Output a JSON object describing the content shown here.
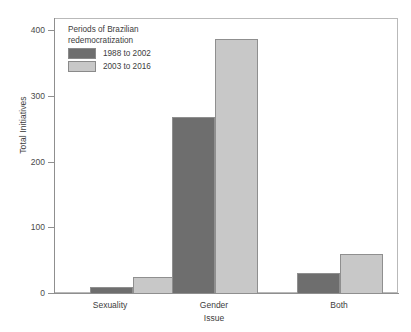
{
  "chart_data": {
    "type": "bar",
    "title": "",
    "xlabel": "Issue",
    "ylabel": "Total Initiatives",
    "categories": [
      "Sexuality",
      "Gender",
      "Both"
    ],
    "series": [
      {
        "name": "1988 to 2002",
        "color": "#6e6e6e",
        "values": [
          11,
          270,
          32
        ]
      },
      {
        "name": "2003 to 2016",
        "color": "#c8c8c8",
        "values": [
          26,
          389,
          61
        ]
      }
    ],
    "ylim": [
      0,
      420
    ],
    "yticks": [
      0,
      100,
      200,
      300,
      400
    ],
    "ytick_labels": [
      "0",
      "100",
      "200",
      "300",
      "400"
    ],
    "grid": false,
    "legend": {
      "position": "top-left-inside",
      "title_line1": "Periods of Brazilian",
      "title_line2": "redemocratization",
      "entries": [
        {
          "label": "1988 to 2002",
          "color": "#6e6e6e"
        },
        {
          "label": "2003 to 2016",
          "color": "#c8c8c8"
        }
      ]
    },
    "axis_color": "#8f8f8f",
    "frame_color": "#b9b9b9",
    "bar_edge_color": "#8f8f8f"
  }
}
